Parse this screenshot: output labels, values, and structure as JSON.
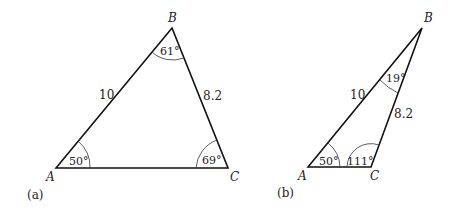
{
  "figures": [
    {
      "caption": "(a)",
      "vertices": {
        "A": "A",
        "B": "B",
        "C": "C"
      },
      "sides": {
        "AB": "10",
        "BC": "8.2"
      },
      "angles": {
        "A": "50°",
        "B": "61°",
        "C": "69°"
      }
    },
    {
      "caption": "(b)",
      "vertices": {
        "A": "A",
        "B": "B",
        "C": "C"
      },
      "sides": {
        "AB": "10",
        "BC": "8.2"
      },
      "angles": {
        "A": "50°",
        "B": "19°",
        "C": "111°"
      }
    }
  ]
}
